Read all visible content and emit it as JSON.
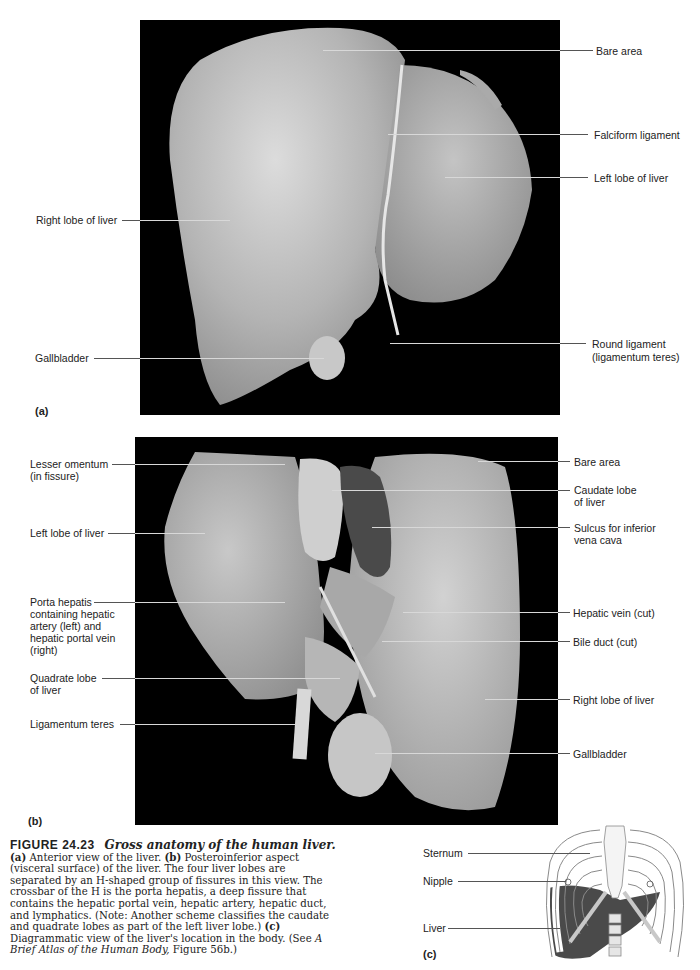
{
  "figure": {
    "number": "FIGURE 24.23",
    "title": "Gross anatomy of the human liver.",
    "caption_parts": {
      "a_tag": "(a)",
      "a_text": " Anterior view of the liver. ",
      "b_tag": "(b)",
      "b_text": " Posteroinferior aspect (visceral surface) of the liver. The four liver lobes are separated by an H-shaped group of fissures in this view. The crossbar of the H is the porta hepatis, a deep fissure that contains the hepatic portal vein, hepatic artery, hepatic duct, and lymphatics. (Note: Another scheme classifies the caudate and quadrate lobes as part of the left liver lobe.) ",
      "c_tag": "(c)",
      "c_text": " Diagrammatic view of the liver's location in the body. (See ",
      "atlas_title": "A Brief Atlas of the Human Body,",
      "atlas_ref": " Figure 56b.)"
    }
  },
  "panel_a": {
    "tag": "(a)",
    "labels": {
      "bare_area": "Bare area",
      "falciform": "Falciform ligament",
      "left_lobe": "Left lobe of liver",
      "right_lobe": "Right lobe of liver",
      "gallbladder": "Gallbladder",
      "round_ligament_1": "Round ligament",
      "round_ligament_2": "(ligamentum teres)"
    }
  },
  "panel_b": {
    "tag": "(b)",
    "labels": {
      "lesser_omentum_1": "Lesser omentum",
      "lesser_omentum_2": "(in fissure)",
      "left_lobe": "Left lobe of liver",
      "porta_1": "Porta hepatis",
      "porta_2": "containing hepatic",
      "porta_3": "artery (left) and",
      "porta_4": "hepatic portal vein",
      "porta_5": "(right)",
      "quadrate_1": "Quadrate lobe",
      "quadrate_2": "of liver",
      "ligamentum_teres": "Ligamentum teres",
      "bare_area": "Bare area",
      "caudate_1": "Caudate lobe",
      "caudate_2": "of liver",
      "sulcus_1": "Sulcus for inferior",
      "sulcus_2": "vena cava",
      "hepatic_vein": "Hepatic vein (cut)",
      "bile_duct": "Bile duct (cut)",
      "right_lobe": "Right lobe of liver",
      "gallbladder": "Gallbladder"
    }
  },
  "panel_c": {
    "tag": "(c)",
    "labels": {
      "sternum": "Sternum",
      "nipple": "Nipple",
      "liver": "Liver"
    },
    "colors": {
      "liver": "#4a4a4a",
      "rib": "#ffffff",
      "cartilage": "#c8c8c8",
      "outline": "#8a8a8a"
    }
  }
}
